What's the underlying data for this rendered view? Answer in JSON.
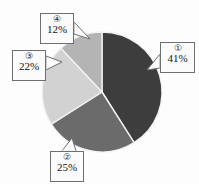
{
  "chart_data": {
    "type": "pie",
    "title": "",
    "categories": [
      "①",
      "②",
      "③",
      "④"
    ],
    "values": [
      41,
      25,
      22,
      12
    ],
    "value_labels": [
      "41%",
      "25%",
      "22%",
      "12%"
    ],
    "unit": "%",
    "total": 100,
    "legend": "none",
    "grid": false,
    "start_angle_deg": 0,
    "direction": "clockwise",
    "colors": [
      "#3d3d3d",
      "#6b6b6b",
      "#d2d2d2",
      "#b4b4b4"
    ],
    "slices": [
      {
        "id": "slice-1",
        "index_label": "①",
        "value": 41,
        "value_label": "41%",
        "color": "#3d3d3d",
        "start_deg": 0,
        "end_deg": 147.6
      },
      {
        "id": "slice-2",
        "index_label": "②",
        "value": 25,
        "value_label": "25%",
        "color": "#6b6b6b",
        "start_deg": 147.6,
        "end_deg": 237.6
      },
      {
        "id": "slice-3",
        "index_label": "③",
        "value": 22,
        "value_label": "22%",
        "color": "#d2d2d2",
        "start_deg": 237.6,
        "end_deg": 316.8
      },
      {
        "id": "slice-4",
        "index_label": "④",
        "value": 12,
        "value_label": "12%",
        "color": "#b4b4b4",
        "start_deg": 316.8,
        "end_deg": 360
      }
    ]
  },
  "callouts": {
    "c1": {
      "index_label": "①",
      "value_label": "41%"
    },
    "c2": {
      "index_label": "②",
      "value_label": "25%"
    },
    "c3": {
      "index_label": "③",
      "value_label": "22%"
    },
    "c4": {
      "index_label": "④",
      "value_label": "12%"
    }
  },
  "style": {
    "background": "#fdfdfd",
    "slice_border": "#f2f2f2",
    "callout_border": "#6e6e6e",
    "callout_fill": "#fbfbfb",
    "text_color": "#141414"
  }
}
